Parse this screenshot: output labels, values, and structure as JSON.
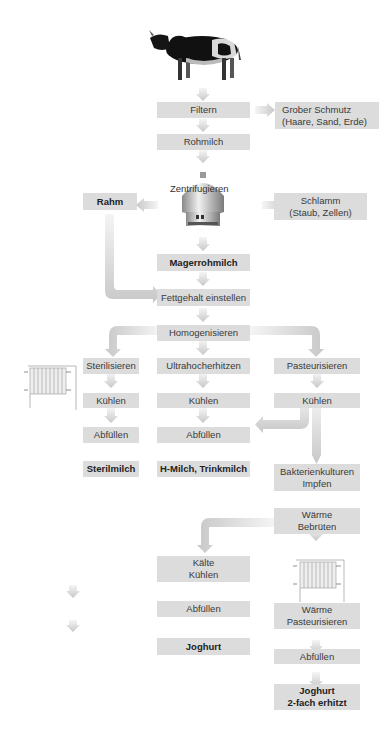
{
  "diagram": {
    "source": {
      "label": "cow-image"
    },
    "nodes": {
      "filtern": "Filtern",
      "grober_schmutz": "Grober Schmutz\n(Haare, Sand, Erde)",
      "rohmilch": "Rohmilch",
      "zentrifugieren": "Zentrifugieren",
      "rahm": "Rahm",
      "schlamm": "Schlamm\n(Staub, Zellen)",
      "magerrohmilch": "Magerrohmilch",
      "fettgehalt": "Fettgehalt einstellen",
      "homogenisieren": "Homogenisieren",
      "sterilisieren": "Sterilisieren",
      "ultrahocherhitzen": "Ultrahocherhitzen",
      "pasteurisieren": "Pasteurisieren",
      "kuehlen_1": "Kühlen",
      "kuehlen_2": "Kühlen",
      "kuehlen_3": "Kühlen",
      "abfuellen_1": "Abfüllen",
      "abfuellen_2": "Abfüllen",
      "sterilmilch": "Sterilmilch",
      "h_milch": "H-Milch, Trinkmilch",
      "bakterienkulturen": "Bakterienkulturen\nImpfen",
      "waerme_bebrueten": "Wärme\nBebrüten",
      "kaelte_kuehlen": "Kälte\nKühlen",
      "abfuellen_3": "Abfüllen",
      "joghurt": "Joghurt",
      "waerme_pasteurisieren": "Wärme\nPasteurisieren",
      "abfuellen_4": "Abfüllen",
      "joghurt_2fach": "Joghurt\n2-fach erhitzt"
    },
    "edges": [
      [
        "cow",
        "filtern"
      ],
      [
        "filtern",
        "grober_schmutz"
      ],
      [
        "filtern",
        "rohmilch"
      ],
      [
        "rohmilch",
        "zentrifugieren"
      ],
      [
        "zentrifugieren",
        "rahm"
      ],
      [
        "zentrifugieren",
        "schlamm"
      ],
      [
        "zentrifugieren",
        "magerrohmilch"
      ],
      [
        "magerrohmilch",
        "fettgehalt"
      ],
      [
        "rahm",
        "fettgehalt"
      ],
      [
        "fettgehalt",
        "homogenisieren"
      ],
      [
        "homogenisieren",
        "sterilisieren"
      ],
      [
        "homogenisieren",
        "ultrahocherhitzen"
      ],
      [
        "homogenisieren",
        "pasteurisieren"
      ],
      [
        "sterilisieren",
        "kuehlen_1"
      ],
      [
        "kuehlen_1",
        "abfuellen_1"
      ],
      [
        "abfuellen_1",
        "sterilmilch"
      ],
      [
        "ultrahocherhitzen",
        "kuehlen_2"
      ],
      [
        "kuehlen_2",
        "abfuellen_2"
      ],
      [
        "abfuellen_2",
        "h_milch"
      ],
      [
        "pasteurisieren",
        "kuehlen_3"
      ],
      [
        "kuehlen_3",
        "abfuellen_2"
      ],
      [
        "kuehlen_3",
        "bakterienkulturen"
      ],
      [
        "bakterienkulturen",
        "waerme_bebrueten"
      ],
      [
        "waerme_bebrueten",
        "kaelte_kuehlen"
      ],
      [
        "waerme_bebrueten",
        "waerme_pasteurisieren"
      ],
      [
        "kaelte_kuehlen",
        "abfuellen_3"
      ],
      [
        "abfuellen_3",
        "joghurt"
      ],
      [
        "waerme_pasteurisieren",
        "abfuellen_4"
      ],
      [
        "abfuellen_4",
        "joghurt_2fach"
      ]
    ],
    "colors": {
      "box": "#dcdcdc",
      "arrow": "#cfcfcf",
      "text": "#3a3a3a"
    }
  }
}
